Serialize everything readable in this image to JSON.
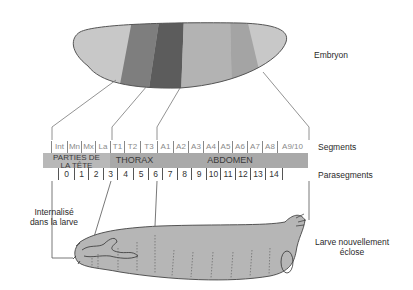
{
  "labels": {
    "embryo": "Embryon",
    "segments": "Segments",
    "parasegments": "Parasegments",
    "internalized_line1": "Internalisé",
    "internalized_line2": "dans la larve",
    "larva_line1": "Larve nouvellement",
    "larva_line2": "éclose"
  },
  "segments": [
    {
      "label": "Int",
      "x": 51,
      "w": 16
    },
    {
      "label": "Mn",
      "x": 67,
      "w": 14
    },
    {
      "label": "Mx",
      "x": 81,
      "w": 14
    },
    {
      "label": "La",
      "x": 95,
      "w": 15
    },
    {
      "label": "T1",
      "x": 110,
      "w": 14
    },
    {
      "label": "T2",
      "x": 124,
      "w": 16
    },
    {
      "label": "T3",
      "x": 140,
      "w": 17
    },
    {
      "label": "A1",
      "x": 157,
      "w": 16
    },
    {
      "label": "A2",
      "x": 173,
      "w": 15
    },
    {
      "label": "A3",
      "x": 188,
      "w": 15
    },
    {
      "label": "A4",
      "x": 203,
      "w": 15
    },
    {
      "label": "A5",
      "x": 218,
      "w": 14
    },
    {
      "label": "A6",
      "x": 232,
      "w": 15
    },
    {
      "label": "A7",
      "x": 247,
      "w": 15
    },
    {
      "label": "A8",
      "x": 262,
      "w": 15
    },
    {
      "label": "A9/10",
      "x": 277,
      "w": 30
    }
  ],
  "regions": {
    "head_line1": "PARTIES DE",
    "head_line2": "LA TÊTE",
    "thorax": "THORAX",
    "abdomen": "ABDOMEN"
  },
  "parasegments": [
    {
      "label": "0",
      "x": 58,
      "w": 16
    },
    {
      "label": "1",
      "x": 74,
      "w": 14
    },
    {
      "label": "2",
      "x": 88,
      "w": 15
    },
    {
      "label": "3",
      "x": 103,
      "w": 14
    },
    {
      "label": "4",
      "x": 117,
      "w": 16
    },
    {
      "label": "5",
      "x": 133,
      "w": 15
    },
    {
      "label": "6",
      "x": 148,
      "w": 14
    },
    {
      "label": "7",
      "x": 162,
      "w": 15
    },
    {
      "label": "8",
      "x": 177,
      "w": 14
    },
    {
      "label": "9",
      "x": 191,
      "w": 15
    },
    {
      "label": "10",
      "x": 206,
      "w": 14
    },
    {
      "label": "11",
      "x": 220,
      "w": 15
    },
    {
      "label": "12",
      "x": 235,
      "w": 15
    },
    {
      "label": "13",
      "x": 250,
      "w": 15
    },
    {
      "label": "14",
      "x": 265,
      "w": 18
    }
  ],
  "colors": {
    "embryo_light": "#c8c8c8",
    "embryo_mid": "#7a7a7a",
    "embryo_dark": "#5a5a5a",
    "embryo_abdomen": "#b4b4b4",
    "embryo_abdomen2": "#a6a6a6",
    "band": "#a9a9a9",
    "larva": "#b5b5b5"
  }
}
